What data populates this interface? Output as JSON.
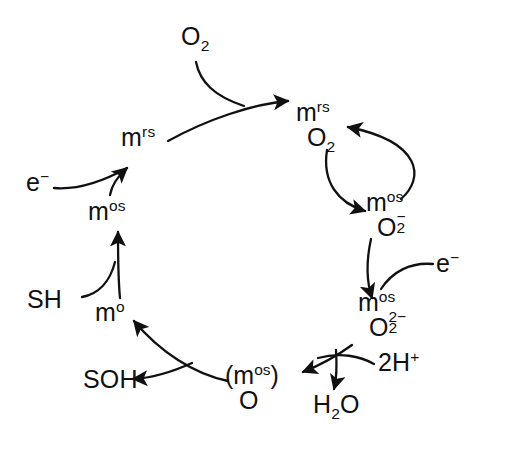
{
  "diagram": {
    "type": "cycle",
    "background_color": "#ffffff",
    "stroke_color": "#111111",
    "species": [
      {
        "id": "m-rs-o2",
        "position": "top-right",
        "metal": "m",
        "metal_state": "rs",
        "ligand": "O",
        "ligand_sub": "2",
        "ligand_charge": ""
      },
      {
        "id": "m-os-superoxide",
        "position": "right",
        "metal": "m",
        "metal_state": "os",
        "ligand": "O",
        "ligand_sub": "2",
        "ligand_charge": "-"
      },
      {
        "id": "m-os-peroxide",
        "position": "bottom-right",
        "metal": "m",
        "metal_state": "os",
        "ligand": "O",
        "ligand_sub": "2",
        "ligand_charge": "2-"
      },
      {
        "id": "m-os-oxo",
        "position": "bottom",
        "metal": "(m",
        "metal_state": "os",
        "metal_close": ")",
        "ligand": "O",
        "ligand_sub": "",
        "ligand_charge": ""
      },
      {
        "id": "m-o",
        "position": "bottom-left",
        "metal": "m",
        "metal_state": "o"
      },
      {
        "id": "m-os",
        "position": "left",
        "metal": "m",
        "metal_state": "os"
      },
      {
        "id": "m-rs",
        "position": "top-left",
        "metal": "m",
        "metal_state": "rs"
      }
    ],
    "labels": {
      "dioxygen": {
        "text": "O",
        "sub": "2"
      },
      "electron_left": {
        "text": "e",
        "sup": "−"
      },
      "electron_right": {
        "text": "e",
        "sup": "−"
      },
      "substrate": {
        "text": "SH"
      },
      "product": {
        "text": "SOH"
      },
      "protons": {
        "text": "2H",
        "sup": "+"
      },
      "water": {
        "text": "H",
        "sub": "2",
        "tail": "O"
      },
      "m_rs_o2": {
        "metal": "m",
        "state": "rs",
        "ligand": "O",
        "sub": "2"
      },
      "m_os_superoxide": {
        "metal": "m",
        "state": "os",
        "ligand": "O",
        "sub": "2",
        "charge": "−"
      },
      "m_os_peroxide": {
        "metal": "m",
        "state": "os",
        "ligand": "O",
        "sub": "2",
        "charge": "2−"
      },
      "m_os_oxo": {
        "metal": "(m",
        "state": "os",
        "close": ")",
        "ligand": "O"
      },
      "m_o": {
        "metal": "m",
        "state": "o"
      },
      "m_os": {
        "metal": "m",
        "state": "os"
      },
      "m_rs": {
        "metal": "m",
        "state": "rs"
      }
    },
    "steps": [
      {
        "from": "m-rs",
        "to": "m-rs-o2",
        "reagent_in": "O2",
        "reagent_out": ""
      },
      {
        "from": "m-rs-o2",
        "to": "m-os-superoxide",
        "reagent_in": "",
        "reagent_out": ""
      },
      {
        "from": "m-os-superoxide",
        "to": "m-rs-o2",
        "reagent_in": "",
        "reagent_out": "",
        "note": "back-arrow"
      },
      {
        "from": "m-os-superoxide",
        "to": "m-os-peroxide",
        "reagent_in": "e-",
        "reagent_out": ""
      },
      {
        "from": "m-os-peroxide",
        "to": "m-os-oxo",
        "reagent_in": "2H+",
        "reagent_out": "H2O"
      },
      {
        "from": "m-os-oxo",
        "to": "m-o",
        "reagent_in": "",
        "reagent_out": "SOH"
      },
      {
        "from": "m-o",
        "to": "m-os",
        "reagent_in": "SH",
        "reagent_out": ""
      },
      {
        "from": "m-os",
        "to": "m-rs",
        "reagent_in": "e-",
        "reagent_out": ""
      }
    ]
  }
}
